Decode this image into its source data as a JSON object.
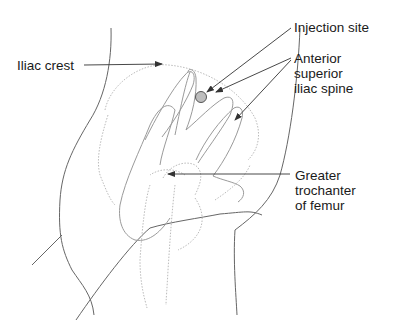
{
  "diagram": {
    "labels": {
      "iliac_crest": "Iliac crest",
      "injection_site": "Injection site",
      "asis_line1": "Anterior",
      "asis_line2": "superior",
      "asis_line3": "iliac spine",
      "gt_line1": "Greater",
      "gt_line2": "trochanter",
      "gt_line3": "of femur"
    },
    "colors": {
      "outline": "#555555",
      "bone_dotted": "#b8b8b8",
      "hand": "#9a9a9a",
      "arrow": "#333333",
      "injection_dot_fill": "#bdbdbd",
      "injection_dot_stroke": "#555555",
      "text": "#1a1a1a"
    }
  }
}
